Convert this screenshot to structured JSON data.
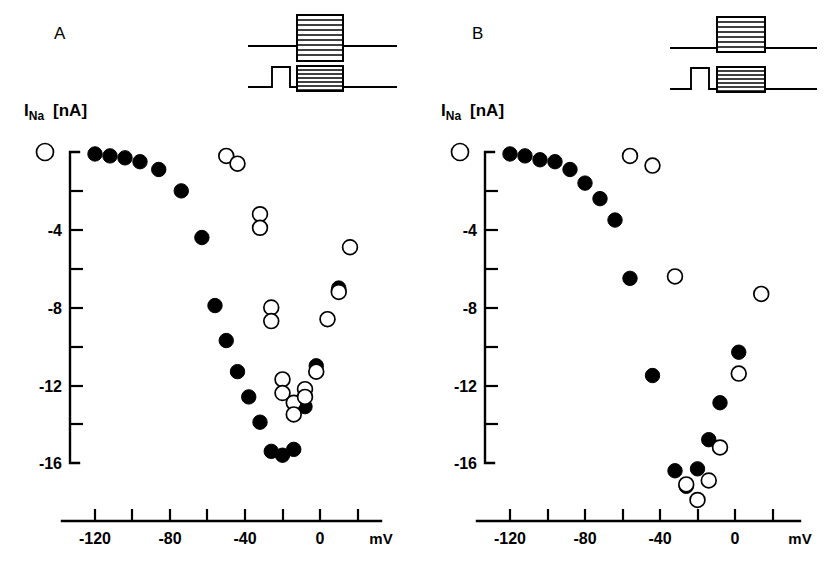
{
  "figure": {
    "width": 834,
    "height": 576,
    "background": "#ffffff",
    "ink_color": "#000000"
  },
  "panels": [
    {
      "id": "A",
      "letter": "A",
      "ylabel_symbol": "I",
      "ylabel_sub": "Na",
      "ylabel_unit": "[nA]"
    },
    {
      "id": "B",
      "letter": "B",
      "ylabel_symbol": "I",
      "ylabel_sub": "Na",
      "ylabel_unit": "[nA]"
    }
  ],
  "axes": {
    "x": {
      "label": "mV",
      "min": -130,
      "max": 30,
      "tick_values": [
        -120,
        -100,
        -80,
        -60,
        -40,
        -20,
        0,
        20
      ],
      "tick_labels": [
        "-120",
        "",
        "-80",
        "",
        "-40",
        "",
        "0",
        ""
      ],
      "major_labeled": [
        "-120",
        "-80",
        "-40",
        "0"
      ]
    },
    "y": {
      "label_symbol": "I",
      "label_sub": "Na",
      "label_unit": "[nA]",
      "min": -16,
      "max": 0,
      "tick_values": [
        0,
        -2,
        -4,
        -6,
        -8,
        -10,
        -12,
        -14,
        -16
      ],
      "tick_labels": [
        "0",
        "",
        "-4",
        "",
        "-8",
        "",
        "-12",
        "",
        "-16"
      ],
      "zero_marker": "open-circle"
    }
  },
  "legend": {
    "filled_series": "control (no prepulse)",
    "open_series": "with prepulse"
  },
  "chart_data": [
    {
      "type": "scatter",
      "panel": "A",
      "title": "A",
      "xlabel": "mV",
      "ylabel": "I_Na [nA]",
      "xlim": [
        -130,
        30
      ],
      "ylim": [
        -16.6,
        0.6
      ],
      "grid": false,
      "legend_position": "none",
      "series": [
        {
          "name": "control",
          "marker": "filled-circle",
          "x": [
            -120,
            -112,
            -104,
            -96,
            -86,
            -74,
            -63,
            -56,
            -50,
            -44,
            -38,
            -32,
            -26,
            -20,
            -14,
            -8,
            -2,
            4
          ],
          "y": [
            -0.1,
            -0.2,
            -0.3,
            -0.5,
            -0.9,
            -2.0,
            -4.4,
            -7.9,
            -9.7,
            -11.3,
            -12.6,
            -13.9,
            -15.4,
            -15.6,
            -15.3,
            -13.1,
            -11.0,
            -8.6
          ],
          "extra_x": [
            10,
            16
          ],
          "extra_y": [
            -7.0,
            -4.9
          ]
        },
        {
          "name": "prepulse",
          "marker": "open-circle",
          "x": [
            -50,
            -44,
            -32,
            -32,
            -26,
            -26,
            -20,
            -20,
            -14,
            -14,
            -8,
            -8,
            -2,
            4,
            10,
            16
          ],
          "y": [
            -0.2,
            -0.6,
            -3.2,
            -3.9,
            -8.0,
            -8.7,
            -11.7,
            -12.4,
            -12.9,
            -13.5,
            -12.2,
            -12.6,
            -11.3,
            -8.6,
            -7.2,
            -4.9
          ]
        }
      ]
    },
    {
      "type": "scatter",
      "panel": "B",
      "title": "B",
      "xlabel": "mV",
      "ylabel": "I_Na [nA]",
      "xlim": [
        -130,
        30
      ],
      "ylim": [
        -18.5,
        0.6
      ],
      "grid": false,
      "legend_position": "none",
      "series": [
        {
          "name": "control",
          "marker": "filled-circle",
          "x": [
            -120,
            -112,
            -104,
            -96,
            -88,
            -80,
            -72,
            -64,
            -56,
            -44,
            -32,
            -26,
            -20,
            -14,
            -8,
            2,
            14
          ],
          "y": [
            -0.1,
            -0.2,
            -0.4,
            -0.5,
            -0.9,
            -1.6,
            -2.4,
            -3.5,
            -6.5,
            -11.5,
            -16.4,
            -17.2,
            -16.3,
            -14.8,
            -12.9,
            -10.3,
            -7.3
          ]
        },
        {
          "name": "prepulse",
          "marker": "open-circle",
          "x": [
            -56,
            -44,
            -32,
            -26,
            -20,
            -14,
            -8,
            2,
            14
          ],
          "y": [
            -0.2,
            -0.7,
            -6.4,
            -17.1,
            -17.9,
            -16.9,
            -15.2,
            -11.4,
            -7.3
          ]
        }
      ]
    }
  ],
  "protocols": [
    {
      "panel": "A",
      "traces": [
        {
          "name": "test-pulse-only",
          "description": "baseline with hatched test pulse box straddling baseline"
        },
        {
          "name": "prepulse-plus-test",
          "description": "square prepulse step then hatched test pulse box"
        }
      ]
    },
    {
      "panel": "B",
      "traces": [
        {
          "name": "test-pulse-only",
          "description": "baseline with hatched test pulse box above baseline"
        },
        {
          "name": "prepulse-plus-test",
          "description": "square prepulse step then hatched test pulse box on baseline"
        }
      ]
    }
  ]
}
